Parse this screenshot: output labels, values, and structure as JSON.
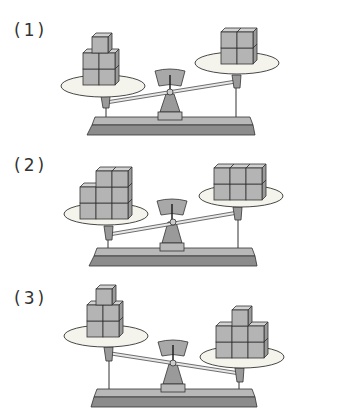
{
  "problems": [
    {
      "label": "(1)",
      "left_cubes": 5,
      "right_cubes": 4,
      "heavier_side": "left",
      "left_arrangement": "2x2 block with 1 cube on top",
      "right_arrangement": "2x2 block"
    },
    {
      "label": "(2)",
      "left_cubes": 8,
      "right_cubes": 6,
      "heavier_side": "left",
      "left_arrangement": "3 columns: 2,3,3 high",
      "right_arrangement": "3x2 block"
    },
    {
      "label": "(3)",
      "left_cubes": 5,
      "right_cubes": 7,
      "heavier_side": "right",
      "left_arrangement": "2x2 block with 1 cube on top",
      "right_arrangement": "3x2 block with 1 cube on top middle"
    }
  ],
  "colors": {
    "cube": "#b4b4b4",
    "cube_top": "#d2d2d2",
    "cube_side": "#9a9a9a",
    "pan": "#f4f4ec",
    "base": "#8c8c8c",
    "base_top": "#b8b8b8",
    "outline": "#333333"
  }
}
